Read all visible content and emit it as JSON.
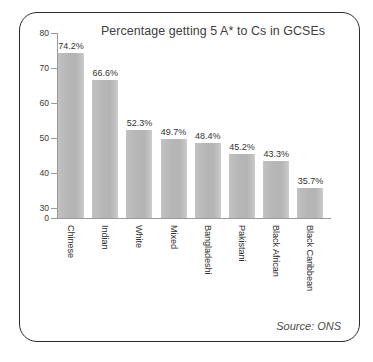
{
  "chart_data": {
    "type": "bar",
    "title": "Percentage getting 5 A* to Cs in GCSEs",
    "xlabel": "",
    "ylabel": "",
    "categories": [
      "Chinese",
      "Indian",
      "White",
      "Mixed",
      "Bangladeshi",
      "Pakistani",
      "Black African",
      "Black Caribbean"
    ],
    "values": [
      74.2,
      66.6,
      52.3,
      49.7,
      48.4,
      45.2,
      43.3,
      35.7
    ],
    "value_labels": [
      "74.2%",
      "66.6%",
      "52.3%",
      "49.7%",
      "48.4%",
      "45.2%",
      "43.3%",
      "35.7%"
    ],
    "ylim": [
      27,
      80
    ],
    "yticks": [
      80,
      70,
      60,
      50,
      40,
      30,
      0
    ],
    "ytick_labels": [
      "80",
      "70",
      "60",
      "50",
      "40",
      "30",
      "0"
    ],
    "axis_break": true,
    "grid": false,
    "legend": null,
    "bar_color": "#b8b8b8",
    "annotations": [
      "Source: ONS"
    ]
  },
  "figure": {
    "source_note": "Source: ONS",
    "frame_color": "#2b2b2b",
    "axis_color": "#9a9a9a",
    "title_color": "#404040"
  }
}
